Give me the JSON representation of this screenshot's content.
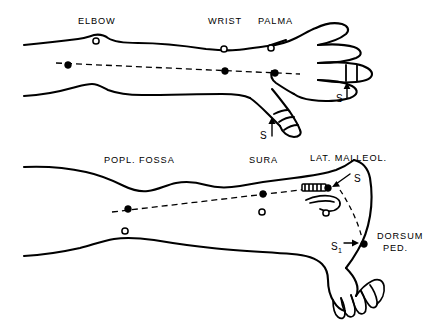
{
  "figure": {
    "background_color": "#ffffff",
    "ink_color": "#000000",
    "width": 441,
    "height": 330
  },
  "upper_limb": {
    "name": "arm-and-hand",
    "site_labels": [
      {
        "id": "elbow",
        "text": "ELBOW",
        "x": 78,
        "y": 24
      },
      {
        "id": "wrist",
        "text": "WRIST",
        "x": 208,
        "y": 24
      },
      {
        "id": "palma",
        "text": "PALMA",
        "x": 258,
        "y": 24
      }
    ],
    "stimulus_markers": [
      {
        "id": "thumb-stim",
        "text": "S",
        "sub": "",
        "x": 260,
        "y": 135
      },
      {
        "id": "finger-stim",
        "text": "S",
        "sub": "",
        "x": 336,
        "y": 98
      }
    ],
    "recording_dots": [
      {
        "id": "elbow-dot",
        "x": 68,
        "y": 65
      },
      {
        "id": "wrist-dot",
        "x": 225,
        "y": 71
      },
      {
        "id": "palma-dot",
        "x": 275,
        "y": 73
      }
    ],
    "reference_circles": [
      {
        "id": "elbow-ref",
        "x": 96,
        "y": 41
      },
      {
        "id": "wrist-ref",
        "x": 224,
        "y": 49
      },
      {
        "id": "palma-ref",
        "x": 271,
        "y": 48
      }
    ]
  },
  "lower_limb": {
    "name": "leg-and-foot",
    "site_labels": [
      {
        "id": "popl-fossa",
        "text": "POPL. FOSSA",
        "x": 104,
        "y": 163
      },
      {
        "id": "sura",
        "text": "SURA",
        "x": 249,
        "y": 163
      },
      {
        "id": "lat-malleol",
        "text": "LAT. MALLEOL.",
        "x": 310,
        "y": 161
      },
      {
        "id": "dorsum-ped-1",
        "text": "DORSUM",
        "x": 377,
        "y": 239
      },
      {
        "id": "dorsum-ped-2",
        "text": "PED.",
        "x": 383,
        "y": 251
      }
    ],
    "stimulus_markers": [
      {
        "id": "lat-malleol-stim",
        "text": "S",
        "sub": "",
        "x": 352,
        "y": 181
      },
      {
        "id": "dorsum-ped-stim",
        "text": "S",
        "sub": "1",
        "x": 340,
        "y": 249
      }
    ],
    "recording_dots": [
      {
        "id": "popl-dot",
        "x": 128,
        "y": 209
      },
      {
        "id": "sura-dot",
        "x": 263,
        "y": 194
      },
      {
        "id": "malleol-dot",
        "x": 328,
        "y": 188
      },
      {
        "id": "dorsum-dot",
        "x": 364,
        "y": 244
      }
    ],
    "reference_circles": [
      {
        "id": "popl-ref",
        "x": 125,
        "y": 231
      },
      {
        "id": "sura-ref",
        "x": 262,
        "y": 212
      },
      {
        "id": "malleol-ref",
        "x": 326,
        "y": 213
      }
    ],
    "electrode_patch": {
      "id": "stimulator-electrode",
      "x": 302,
      "y": 184,
      "width": 24,
      "height": 7
    }
  }
}
